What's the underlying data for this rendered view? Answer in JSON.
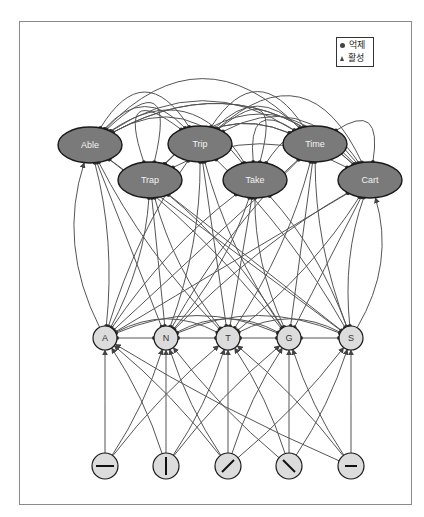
{
  "legend": {
    "inhibit_label": "억제",
    "activate_label": "활성"
  },
  "colors": {
    "word_node_fill": "#7a7a7a",
    "letter_node_fill": "#dcdcdc",
    "feature_node_fill": "#dcdcdc",
    "edge": "#555555",
    "node_stroke": "#1a1a1a",
    "frame": "#8a8a8a"
  },
  "word_nodes": [
    {
      "id": "able",
      "label": "Able",
      "x": 90,
      "y": 145
    },
    {
      "id": "trip",
      "label": "Trip",
      "x": 200,
      "y": 144
    },
    {
      "id": "time",
      "label": "Time",
      "x": 315,
      "y": 144
    },
    {
      "id": "trap",
      "label": "Trap",
      "x": 150,
      "y": 180
    },
    {
      "id": "take",
      "label": "Take",
      "x": 255,
      "y": 180
    },
    {
      "id": "cart",
      "label": "Cart",
      "x": 370,
      "y": 180
    }
  ],
  "letter_nodes": [
    {
      "id": "A",
      "label": "A",
      "x": 105,
      "y": 338
    },
    {
      "id": "N",
      "label": "N",
      "x": 166,
      "y": 338
    },
    {
      "id": "T",
      "label": "T",
      "x": 228,
      "y": 338
    },
    {
      "id": "G",
      "label": "G",
      "x": 289,
      "y": 338
    },
    {
      "id": "S",
      "label": "S",
      "x": 351,
      "y": 338
    }
  ],
  "feature_nodes": [
    {
      "id": "horizontal",
      "glyph": "horizontal-line",
      "x": 105,
      "y": 466
    },
    {
      "id": "vertical",
      "glyph": "vertical-line",
      "x": 166,
      "y": 466
    },
    {
      "id": "slash",
      "glyph": "forward-slash",
      "x": 228,
      "y": 466
    },
    {
      "id": "backslash",
      "glyph": "back-slash",
      "x": 289,
      "y": 466
    },
    {
      "id": "short-horizontal",
      "glyph": "short-horizontal-line",
      "x": 351,
      "y": 466
    }
  ],
  "word_to_word_edges": [
    [
      "able",
      "trip"
    ],
    [
      "able",
      "time"
    ],
    [
      "able",
      "take"
    ],
    [
      "able",
      "cart"
    ],
    [
      "able",
      "trap"
    ],
    [
      "trip",
      "time"
    ],
    [
      "trip",
      "cart"
    ],
    [
      "trip",
      "able"
    ],
    [
      "trip",
      "take"
    ],
    [
      "time",
      "able"
    ],
    [
      "time",
      "trap"
    ],
    [
      "time",
      "cart"
    ],
    [
      "time",
      "trip"
    ],
    [
      "trap",
      "trip"
    ],
    [
      "trap",
      "cart"
    ],
    [
      "trap",
      "time"
    ],
    [
      "take",
      "able"
    ],
    [
      "take",
      "cart"
    ],
    [
      "cart",
      "able"
    ],
    [
      "cart",
      "trip"
    ],
    [
      "cart",
      "trap"
    ],
    [
      "take",
      "time"
    ]
  ],
  "word_letter_edges": [
    [
      "able",
      "A"
    ],
    [
      "able",
      "N"
    ],
    [
      "able",
      "T"
    ],
    [
      "able",
      "G"
    ],
    [
      "able",
      "S"
    ],
    [
      "trip",
      "A"
    ],
    [
      "trip",
      "N"
    ],
    [
      "trip",
      "T"
    ],
    [
      "trip",
      "G"
    ],
    [
      "trip",
      "S"
    ],
    [
      "time",
      "A"
    ],
    [
      "time",
      "N"
    ],
    [
      "time",
      "T"
    ],
    [
      "time",
      "G"
    ],
    [
      "time",
      "S"
    ],
    [
      "trap",
      "A"
    ],
    [
      "trap",
      "N"
    ],
    [
      "trap",
      "T"
    ],
    [
      "trap",
      "G"
    ],
    [
      "trap",
      "S"
    ],
    [
      "take",
      "A"
    ],
    [
      "take",
      "N"
    ],
    [
      "take",
      "T"
    ],
    [
      "take",
      "G"
    ],
    [
      "take",
      "S"
    ],
    [
      "cart",
      "A"
    ],
    [
      "cart",
      "N"
    ],
    [
      "cart",
      "T"
    ],
    [
      "cart",
      "G"
    ],
    [
      "cart",
      "S"
    ]
  ],
  "letter_letter_edges": [
    [
      "A",
      "N"
    ],
    [
      "N",
      "T"
    ],
    [
      "T",
      "G"
    ],
    [
      "G",
      "S"
    ],
    [
      "A",
      "T"
    ],
    [
      "N",
      "G"
    ],
    [
      "T",
      "S"
    ],
    [
      "A",
      "G"
    ],
    [
      "N",
      "S"
    ]
  ],
  "letter_feature_edges": [
    [
      "horizontal",
      "A"
    ],
    [
      "horizontal",
      "N"
    ],
    [
      "horizontal",
      "T"
    ],
    [
      "vertical",
      "A"
    ],
    [
      "vertical",
      "N"
    ],
    [
      "vertical",
      "T"
    ],
    [
      "vertical",
      "G"
    ],
    [
      "slash",
      "A"
    ],
    [
      "slash",
      "N"
    ],
    [
      "slash",
      "T"
    ],
    [
      "slash",
      "G"
    ],
    [
      "slash",
      "S"
    ],
    [
      "backslash",
      "N"
    ],
    [
      "backslash",
      "T"
    ],
    [
      "backslash",
      "G"
    ],
    [
      "backslash",
      "S"
    ],
    [
      "short-horizontal",
      "A"
    ],
    [
      "short-horizontal",
      "T"
    ],
    [
      "short-horizontal",
      "G"
    ],
    [
      "short-horizontal",
      "S"
    ]
  ]
}
